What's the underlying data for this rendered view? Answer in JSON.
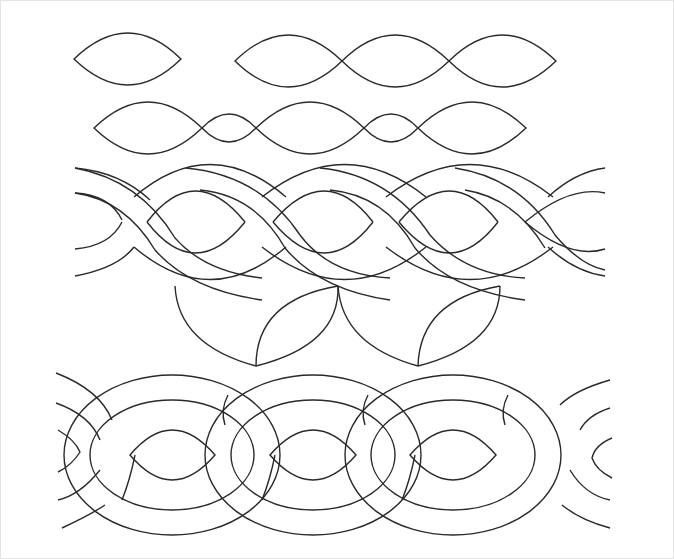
{
  "diagram": {
    "type": "quilting-pattern-sheet",
    "background": "#ffffff",
    "stroke_color": "#2a2a2a",
    "rows": [
      {
        "name": "single-leaf",
        "shapes": 1
      },
      {
        "name": "triple-leaf-chain",
        "shapes": 3
      },
      {
        "name": "leaf-chain-with-small-leaves",
        "large": 3,
        "small": 2
      },
      {
        "name": "twisted-cable",
        "twists": 4
      },
      {
        "name": "tulip-petals",
        "petals": 4
      },
      {
        "name": "double-cable-braid",
        "loops": 4
      }
    ]
  }
}
